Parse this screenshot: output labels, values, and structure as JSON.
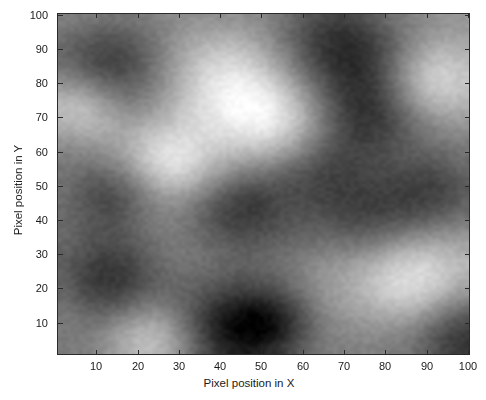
{
  "figure": {
    "type": "image-plot",
    "background_color": "#ffffff",
    "axis_color": "#2a2a2a"
  },
  "axes": {
    "x": {
      "label": "Pixel position in X",
      "ticks": [
        10,
        20,
        30,
        40,
        50,
        60,
        70,
        80,
        90,
        100
      ],
      "tick_labels": [
        "10",
        "20",
        "30",
        "40",
        "50",
        "60",
        "70",
        "80",
        "90",
        "100"
      ],
      "range": [
        0.5,
        100.5
      ]
    },
    "y": {
      "label": "Pixel position in Y",
      "ticks": [
        10,
        20,
        30,
        40,
        50,
        60,
        70,
        80,
        90,
        100
      ],
      "tick_labels": [
        "10",
        "20",
        "30",
        "40",
        "50",
        "60",
        "70",
        "80",
        "90",
        "100"
      ],
      "range": [
        0.5,
        100.5
      ]
    }
  },
  "chart_data": {
    "type": "heatmap",
    "title": "",
    "xlabel": "Pixel position in X",
    "ylabel": "Pixel position in Y",
    "xlim": [
      0.5,
      100.5
    ],
    "ylim": [
      0.5,
      100.5
    ],
    "xticks": [
      10,
      20,
      30,
      40,
      50,
      60,
      70,
      80,
      90,
      100
    ],
    "yticks": [
      10,
      20,
      30,
      40,
      50,
      60,
      70,
      80,
      90,
      100
    ],
    "grid": false,
    "legend": "none",
    "colormap": "gray",
    "colormap_min_hex": "#000000",
    "colormap_max_hex": "#ffffff",
    "value_range": [
      0,
      1
    ],
    "grid_size": [
      100,
      100
    ],
    "smoothing_sigma": 4.5,
    "random_seed": 20240517,
    "features": [
      {
        "kind": "dark-blob",
        "x": 12,
        "y": 79,
        "intensity": 0.12,
        "radius": 9
      },
      {
        "kind": "dark-blob",
        "x": 39,
        "y": 93,
        "intensity": 0.06,
        "radius": 11
      },
      {
        "kind": "dark-blob",
        "x": 52,
        "y": 92,
        "intensity": 0.1,
        "radius": 8
      },
      {
        "kind": "bright-blob",
        "x": 24,
        "y": 96,
        "intensity": 0.92,
        "radius": 8
      },
      {
        "kind": "bright-blob",
        "x": 86,
        "y": 78,
        "intensity": 0.97,
        "radius": 10
      },
      {
        "kind": "dark-blob",
        "x": 99,
        "y": 96,
        "intensity": 0.08,
        "radius": 9
      },
      {
        "kind": "dark-blob",
        "x": 13,
        "y": 54,
        "intensity": 0.18,
        "radius": 8
      },
      {
        "kind": "bright-blob",
        "x": 28,
        "y": 44,
        "intensity": 0.93,
        "radius": 8
      },
      {
        "kind": "dark-blob",
        "x": 46,
        "y": 58,
        "intensity": 0.12,
        "radius": 9
      },
      {
        "kind": "dark-blob",
        "x": 63,
        "y": 46,
        "intensity": 0.2,
        "radius": 9
      },
      {
        "kind": "dark-blob",
        "x": 78,
        "y": 60,
        "intensity": 0.16,
        "radius": 10
      },
      {
        "kind": "dark-blob",
        "x": 94,
        "y": 52,
        "intensity": 0.22,
        "radius": 8
      },
      {
        "kind": "bright-blob",
        "x": 54,
        "y": 34,
        "intensity": 0.9,
        "radius": 9
      },
      {
        "kind": "dark-blob",
        "x": 13,
        "y": 17,
        "intensity": 0.1,
        "radius": 10
      },
      {
        "kind": "bright-blob",
        "x": 42,
        "y": 22,
        "intensity": 0.95,
        "radius": 11
      },
      {
        "kind": "dark-blob",
        "x": 70,
        "y": 10,
        "intensity": 0.04,
        "radius": 11
      },
      {
        "kind": "dark-blob",
        "x": 76,
        "y": 30,
        "intensity": 0.14,
        "radius": 9
      },
      {
        "kind": "bright-blob",
        "x": 92,
        "y": 20,
        "intensity": 0.88,
        "radius": 8
      },
      {
        "kind": "bright-blob",
        "x": 6,
        "y": 28,
        "intensity": 0.9,
        "radius": 8
      }
    ]
  }
}
